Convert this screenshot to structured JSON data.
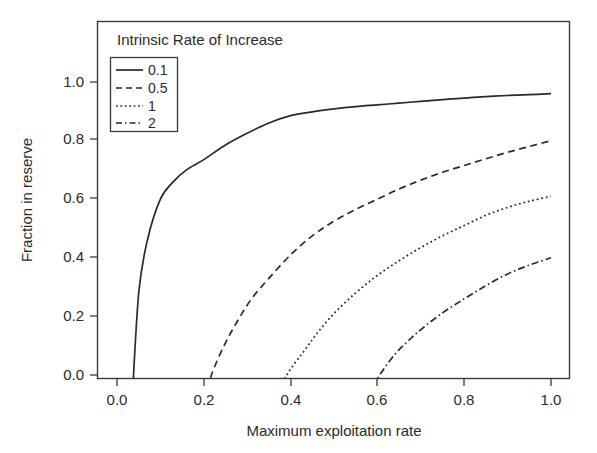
{
  "chart_data": {
    "type": "line",
    "title": "",
    "xlabel": "Maximum exploitation rate",
    "ylabel": "Fraction in reserve",
    "xlim": [
      -0.04,
      1.06
    ],
    "ylim": [
      -0.085,
      1.04
    ],
    "xticks": [
      0.0,
      0.2,
      0.4,
      0.6,
      0.8,
      1.0
    ],
    "xtick_labels": [
      "0.0",
      "0.2",
      "0.4",
      "0.6",
      "0.8",
      "1.0"
    ],
    "yticks": [
      0.0,
      0.2,
      0.4,
      0.6,
      0.8,
      1.0
    ],
    "ytick_labels": [
      "0.0",
      "0.2",
      "0.4",
      "0.6",
      "0.8",
      "1.0"
    ],
    "grid": false,
    "legend_position": "top-left",
    "legend_title": "Intrinsic Rate of Increase",
    "series": [
      {
        "name": "0.1",
        "style": "solid",
        "x": [
          0.035,
          0.05,
          0.07,
          0.1,
          0.13,
          0.16,
          0.2,
          0.25,
          0.3,
          0.35,
          0.4,
          0.45,
          0.5,
          0.55,
          0.6,
          0.65,
          0.7,
          0.75,
          0.8,
          0.85,
          0.9,
          0.95,
          1.0
        ],
        "y": [
          -0.085,
          0.28,
          0.46,
          0.6,
          0.66,
          0.7,
          0.735,
          0.785,
          0.825,
          0.86,
          0.885,
          0.898,
          0.908,
          0.916,
          0.922,
          0.928,
          0.934,
          0.94,
          0.945,
          0.95,
          0.954,
          0.957,
          0.96
        ]
      },
      {
        "name": "0.5",
        "style": "dashed",
        "x": [
          0.2,
          0.22,
          0.25,
          0.28,
          0.31,
          0.35,
          0.4,
          0.45,
          0.5,
          0.55,
          0.6,
          0.65,
          0.7,
          0.75,
          0.8,
          0.85,
          0.9,
          0.95,
          1.0
        ],
        "y": [
          -0.085,
          0.01,
          0.11,
          0.19,
          0.26,
          0.33,
          0.41,
          0.475,
          0.525,
          0.565,
          0.6,
          0.635,
          0.665,
          0.692,
          0.715,
          0.738,
          0.76,
          0.78,
          0.8
        ]
      },
      {
        "name": "1",
        "style": "dotted",
        "x": [
          0.365,
          0.38,
          0.4,
          0.43,
          0.46,
          0.5,
          0.55,
          0.6,
          0.65,
          0.7,
          0.75,
          0.8,
          0.85,
          0.9,
          0.95,
          1.0
        ],
        "y": [
          -0.085,
          -0.03,
          0.02,
          0.08,
          0.14,
          0.21,
          0.28,
          0.34,
          0.39,
          0.435,
          0.475,
          0.51,
          0.545,
          0.572,
          0.593,
          0.61
        ]
      },
      {
        "name": "2",
        "style": "dashdot",
        "x": [
          0.575,
          0.59,
          0.61,
          0.64,
          0.67,
          0.7,
          0.75,
          0.8,
          0.85,
          0.9,
          0.95,
          1.0
        ],
        "y": [
          -0.085,
          -0.04,
          0.01,
          0.07,
          0.115,
          0.155,
          0.212,
          0.26,
          0.305,
          0.345,
          0.375,
          0.4
        ]
      }
    ]
  },
  "legend": {
    "title": "Intrinsic Rate of Increase",
    "items": [
      {
        "label": "0.1",
        "style": "solid"
      },
      {
        "label": "0.5",
        "style": "dashed"
      },
      {
        "label": "1",
        "style": "dotted"
      },
      {
        "label": "2",
        "style": "dashdot"
      }
    ]
  },
  "axes": {
    "x_title": "Maximum exploitation rate",
    "y_title": "Fraction in reserve",
    "x_ticks": [
      "0.0",
      "0.2",
      "0.4",
      "0.6",
      "0.8",
      "1.0"
    ],
    "y_ticks": [
      "0.0",
      "0.2",
      "0.4",
      "0.6",
      "0.8",
      "1.0"
    ]
  },
  "colors": {
    "line": "#2a2a2a",
    "frame": "#3a3a3a",
    "text": "#2b2b2b",
    "background": "#ffffff"
  }
}
